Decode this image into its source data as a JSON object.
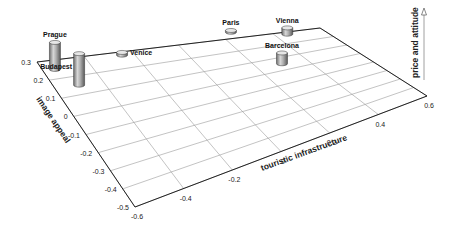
{
  "chart_data": {
    "type": "3d-bar",
    "title": "",
    "x_axis": {
      "label": "touristic infrastructure",
      "ticks": [
        "-0.6",
        "-0.4",
        "-0.2",
        "0",
        "0.2",
        "0.4",
        "0.6"
      ],
      "range": [
        -0.6,
        0.6
      ]
    },
    "y_axis": {
      "label": "image appeal",
      "ticks": [
        "0.3",
        "0.2",
        "0.1",
        "0",
        "-0.1",
        "-0.2",
        "-0.3",
        "-0.4",
        "-0.5"
      ],
      "range": [
        -0.5,
        0.3
      ]
    },
    "z_axis": {
      "label": "price and attitude",
      "direction": "up"
    },
    "grid": true,
    "points": [
      {
        "name": "Prague",
        "x": -0.55,
        "y": 0.25,
        "z": 0.3
      },
      {
        "name": "Budapest",
        "x": -0.5,
        "y": 0.15,
        "z": 0.35
      },
      {
        "name": "Venice",
        "x": -0.25,
        "y": 0.28,
        "z": 0.03
      },
      {
        "name": "Paris",
        "x": 0.25,
        "y": 0.35,
        "z": 0.02
      },
      {
        "name": "Vienna",
        "x": 0.45,
        "y": 0.28,
        "z": 0.07
      },
      {
        "name": "Barcelona",
        "x": 0.3,
        "y": 0.05,
        "z": 0.12
      }
    ]
  }
}
